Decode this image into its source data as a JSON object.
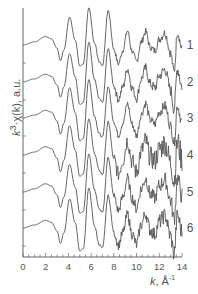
{
  "chart_data": {
    "type": "line",
    "title": "",
    "xlabel": "k, Å⁻¹",
    "ylabel": "k³·χ(k), a.u.",
    "xlim": [
      0,
      14
    ],
    "xticks": [
      0,
      2,
      4,
      6,
      8,
      10,
      12,
      14
    ],
    "minor_tick_step": 0.5,
    "grid": false,
    "legend_position": "right, inline labels",
    "line_color": "#555555",
    "series": [
      {
        "name": "1",
        "offset_px": 45
      },
      {
        "name": "2",
        "offset_px": 82
      },
      {
        "name": "3",
        "offset_px": 118
      },
      {
        "name": "4",
        "offset_px": 155
      },
      {
        "name": "5",
        "offset_px": 192
      },
      {
        "name": "6",
        "offset_px": 228
      }
    ],
    "shared_shape": {
      "description": "EXAFS oscillation: flat to k≈2.5, dip k≈3.3, peaks at k≈4.1, 5.8, 7.5, 9.2, 10.8, 12.5; noisy beyond k≈8",
      "k": [
        0,
        1,
        2,
        2.5,
        3.0,
        3.3,
        3.6,
        4.1,
        4.6,
        5.0,
        5.3,
        5.8,
        6.3,
        6.7,
        7.0,
        7.5,
        8.0,
        8.4,
        8.8,
        9.2,
        9.6,
        10.0,
        10.4,
        10.8,
        11.2,
        11.6,
        12.0,
        12.5,
        13.0,
        13.3,
        13.6,
        14.0
      ],
      "y": [
        0,
        0.3,
        0.8,
        0.6,
        -0.3,
        -1.6,
        -0.5,
        2.9,
        0.5,
        -2.2,
        -2.0,
        3.8,
        0.2,
        -1.6,
        -2.0,
        3.3,
        -0.4,
        -1.8,
        -0.5,
        1.4,
        -0.6,
        -1.7,
        0.3,
        1.4,
        -0.2,
        -0.6,
        0.6,
        1.2,
        -0.8,
        -2.6,
        1.3,
        -0.4
      ],
      "y_unit_px": 10,
      "noise_start_k": 8.0,
      "noise_amplitude": [
        0.25,
        0.35,
        0.3,
        0.7,
        0.45,
        0.45
      ]
    }
  },
  "labels": {
    "ylabel_k": "k",
    "ylabel_sup": "3",
    "ylabel_rest": "·χ(k), a.u.",
    "xlabel_k": "k",
    "xlabel_rest": ", Å",
    "xlabel_sup": "-1"
  }
}
